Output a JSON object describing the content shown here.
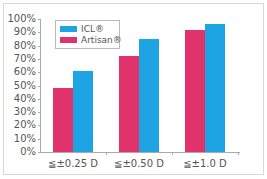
{
  "chart_data": {
    "type": "bar",
    "title": "",
    "xlabel": "",
    "ylabel": "",
    "ylim": [
      0,
      100
    ],
    "yticks": [
      "0%",
      "10%",
      "20%",
      "30%",
      "40%",
      "50%",
      "60%",
      "70%",
      "80%",
      "90%",
      "100%"
    ],
    "categories": [
      "≦±0.25 D",
      "≦±0.50 D",
      "≦±1.0 D"
    ],
    "series": [
      {
        "name": "Artisan®",
        "color": "#e0336b",
        "values": [
          48,
          72,
          92
        ]
      },
      {
        "name": "ICL®",
        "color": "#1ea3e3",
        "values": [
          61,
          85,
          96
        ]
      }
    ],
    "legend": {
      "position": "upper-left",
      "entries": [
        "ICL®",
        "Artisan®"
      ]
    },
    "grid": false
  }
}
